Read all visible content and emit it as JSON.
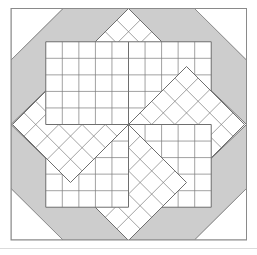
{
  "figure": {
    "name": "lone-star-quilt-block",
    "width": 257,
    "height": 255,
    "background": "#ffffff"
  },
  "colors": {
    "background": "#ffffff",
    "patch_white": "#ffffff",
    "patch_gray": "#cdcdcd",
    "outline": "#6e6e6e",
    "outline_light": "#8d8d8d",
    "hatch_line": "#7a7a7a",
    "frame": "#8a8a8a",
    "scan_artifact": "#cfcfcf"
  },
  "frame": {
    "name": "block-frame",
    "left": 11,
    "top": 8.5,
    "right": 246.5,
    "bottom": 240,
    "stroke_width": 1
  },
  "geometry": {
    "center_x": 128.5,
    "center_y": 124.5,
    "octagon_inset": 52,
    "star_outer_radius": 116,
    "diamond_grid_divisions": 5,
    "star_points": 8,
    "corner_triangles": 4,
    "edge_diamonds": 4,
    "corner_squares": 4
  },
  "legend": {
    "items": [
      {
        "label": "Background octagon",
        "color": "#cdcdcd"
      },
      {
        "label": "Corner triangle",
        "color": "#ffffff"
      },
      {
        "label": "Corner square",
        "color": "#ffffff"
      },
      {
        "label": "Edge diamond",
        "color": "#ffffff"
      },
      {
        "label": "Pieced star diamond",
        "color": "#ffffff"
      }
    ]
  },
  "artifacts": {
    "bottom_scan_line_y": 248
  }
}
